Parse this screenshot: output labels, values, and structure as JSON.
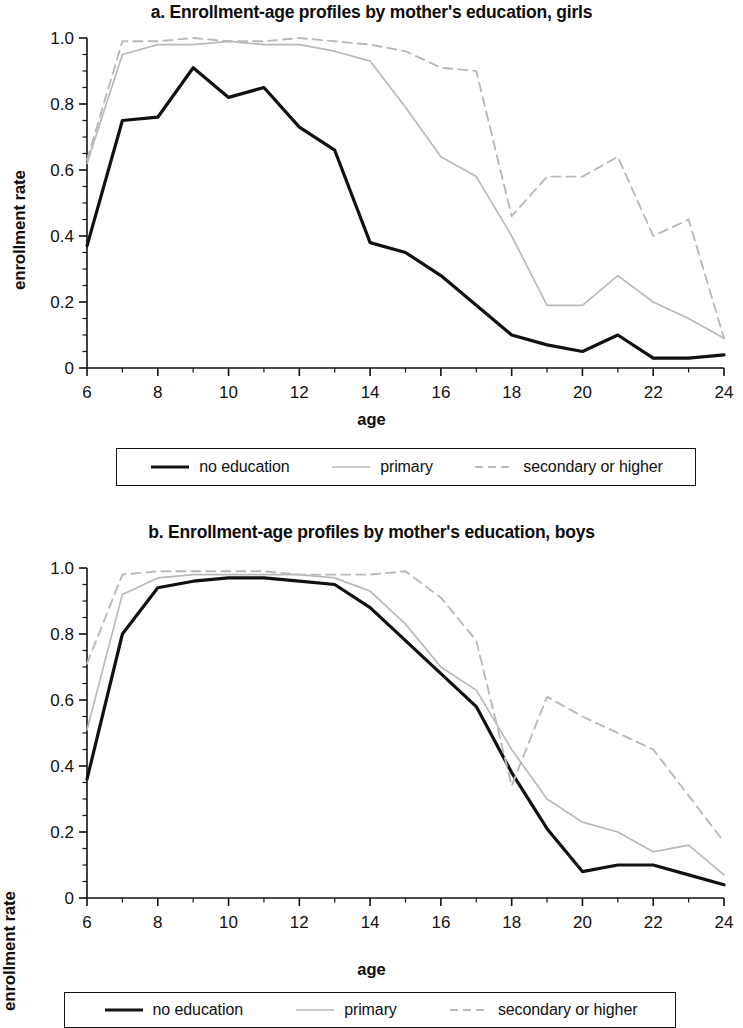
{
  "figure": {
    "background_color": "#ffffff",
    "ylabel": "enrollment rate",
    "xlabel": "age"
  },
  "legend": {
    "items": [
      {
        "label": "no education",
        "style": "solid",
        "color": "#111111",
        "width": 3.2
      },
      {
        "label": "primary",
        "style": "solid",
        "color": "#b9b9b9",
        "width": 1.7
      },
      {
        "label": "secondary or higher",
        "style": "dashed",
        "color": "#b9b9b9",
        "width": 1.9
      }
    ]
  },
  "panel_a": {
    "title": "a. Enrollment-age profiles by mother's education, girls",
    "ylabel": "enrollment rate",
    "xlabel": "age"
  },
  "panel_b": {
    "title": "b. Enrollment-age profiles by mother's education, boys",
    "ylabel": "enrollment rate",
    "xlabel": "age"
  },
  "chart_data": [
    {
      "type": "line",
      "id": "panel_a",
      "title": "a. Enrollment-age profiles by mother's education, girls",
      "xlabel": "age",
      "ylabel": "enrollment rate",
      "xlim": [
        6,
        24
      ],
      "ylim": [
        0,
        1.0
      ],
      "xticks": [
        6,
        8,
        10,
        12,
        14,
        16,
        18,
        20,
        22,
        24
      ],
      "xticklabels": [
        "6",
        "8",
        "10",
        "12",
        "14",
        "16",
        "18",
        "20",
        "22",
        "24"
      ],
      "yticks": [
        0,
        0.2,
        0.4,
        0.6,
        0.8,
        1.0
      ],
      "yticklabels": [
        "0",
        "0.2",
        "0.4",
        "0.6",
        "0.8",
        "1.0"
      ],
      "minor_xticks": [
        7,
        9,
        11,
        13,
        15,
        17,
        19,
        21,
        23
      ],
      "minor_yticks": [
        0.05,
        0.1,
        0.15,
        0.25,
        0.3,
        0.35,
        0.45,
        0.5,
        0.55,
        0.65,
        0.7,
        0.75,
        0.85,
        0.9,
        0.95
      ],
      "grid": false,
      "legend_position": "below",
      "x": [
        6,
        7,
        8,
        9,
        10,
        11,
        12,
        13,
        14,
        15,
        16,
        17,
        18,
        19,
        20,
        21,
        22,
        23,
        24
      ],
      "series": [
        {
          "name": "no education",
          "style": "solid",
          "color": "#111111",
          "values": [
            0.37,
            0.75,
            0.76,
            0.91,
            0.82,
            0.85,
            0.73,
            0.66,
            0.38,
            0.35,
            0.28,
            0.19,
            0.1,
            0.07,
            0.05,
            0.1,
            0.03,
            0.03,
            0.04
          ]
        },
        {
          "name": "primary",
          "style": "solid",
          "color": "#b9b9b9",
          "values": [
            0.62,
            0.95,
            0.98,
            0.98,
            0.99,
            0.98,
            0.98,
            0.96,
            0.93,
            0.79,
            0.64,
            0.58,
            0.4,
            0.19,
            0.19,
            0.28,
            0.2,
            0.15,
            0.09
          ]
        },
        {
          "name": "secondary or higher",
          "style": "dashed",
          "color": "#b9b9b9",
          "values": [
            0.63,
            0.99,
            0.99,
            1.0,
            0.99,
            0.99,
            1.0,
            0.99,
            0.98,
            0.96,
            0.91,
            0.9,
            0.46,
            0.58,
            0.58,
            0.64,
            0.4,
            0.45,
            0.09
          ]
        }
      ]
    },
    {
      "type": "line",
      "id": "panel_b",
      "title": "b. Enrollment-age profiles by mother's education, boys",
      "xlabel": "age",
      "ylabel": "enrollment rate",
      "xlim": [
        6,
        24
      ],
      "ylim": [
        0,
        1.0
      ],
      "xticks": [
        6,
        8,
        10,
        12,
        14,
        16,
        18,
        20,
        22,
        24
      ],
      "xticklabels": [
        "6",
        "8",
        "10",
        "12",
        "14",
        "16",
        "18",
        "20",
        "22",
        "24"
      ],
      "yticks": [
        0,
        0.2,
        0.4,
        0.6,
        0.8,
        1.0
      ],
      "yticklabels": [
        "0",
        "0.2",
        "0.4",
        "0.6",
        "0.8",
        "1.0"
      ],
      "minor_xticks": [
        7,
        9,
        11,
        13,
        15,
        17,
        19,
        21,
        23
      ],
      "minor_yticks": [
        0.05,
        0.1,
        0.15,
        0.25,
        0.3,
        0.35,
        0.45,
        0.5,
        0.55,
        0.65,
        0.7,
        0.75,
        0.85,
        0.9,
        0.95
      ],
      "grid": false,
      "legend_position": "below",
      "x": [
        6,
        7,
        8,
        9,
        10,
        11,
        12,
        13,
        14,
        15,
        16,
        17,
        18,
        19,
        20,
        21,
        22,
        23,
        24
      ],
      "series": [
        {
          "name": "no education",
          "style": "solid",
          "color": "#111111",
          "values": [
            0.36,
            0.8,
            0.94,
            0.96,
            0.97,
            0.97,
            0.96,
            0.95,
            0.88,
            0.78,
            0.68,
            0.58,
            0.38,
            0.21,
            0.08,
            0.1,
            0.1,
            0.07,
            0.04
          ]
        },
        {
          "name": "primary",
          "style": "solid",
          "color": "#b9b9b9",
          "values": [
            0.51,
            0.92,
            0.97,
            0.98,
            0.98,
            0.98,
            0.98,
            0.97,
            0.93,
            0.83,
            0.7,
            0.63,
            0.45,
            0.3,
            0.23,
            0.2,
            0.14,
            0.16,
            0.07
          ]
        },
        {
          "name": "secondary or higher",
          "style": "dashed",
          "color": "#b9b9b9",
          "values": [
            0.71,
            0.98,
            0.99,
            0.99,
            0.99,
            0.99,
            0.98,
            0.98,
            0.98,
            0.99,
            0.91,
            0.78,
            0.34,
            0.61,
            0.55,
            0.5,
            0.45,
            0.31,
            0.17
          ]
        }
      ]
    }
  ]
}
